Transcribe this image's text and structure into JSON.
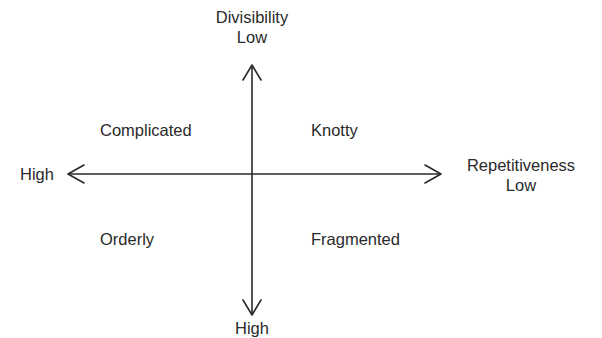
{
  "diagram": {
    "type": "2x2 quadrant matrix",
    "vertical_axis": {
      "name": "Divisibility",
      "top_label": "Low",
      "bottom_label": "High"
    },
    "horizontal_axis": {
      "name": "Repetitiveness",
      "left_label": "High",
      "right_label": "Low"
    },
    "quadrants": {
      "top_left": "Complicated",
      "top_right": "Knotty",
      "bottom_left": "Orderly",
      "bottom_right": "Fragmented"
    },
    "line_color": "#2a2a2a"
  }
}
